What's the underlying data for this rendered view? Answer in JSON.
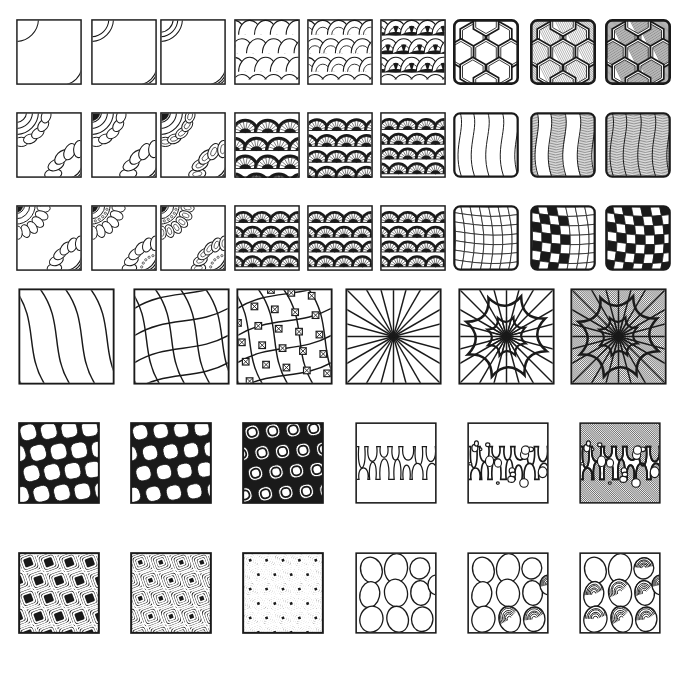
{
  "sheet": {
    "title": "Zentangle Pattern Step-By-Step Reference Sheet",
    "background_color": "#ffffff",
    "ink_color": "#1a1a1a",
    "width": 681,
    "height": 675,
    "row_count": 6,
    "tile_total": 48
  },
  "rows": [
    {
      "index": 1,
      "y": 19,
      "tile_size": 66,
      "groups": [
        {
          "name": "crescent-arcs",
          "label": "Crescent Arcs",
          "steps": [
            "single arc corners",
            "double arc corners",
            "triple arc corners"
          ],
          "tiles": [
            {
              "x": 16,
              "pattern": "arcs",
              "arcs": 1,
              "fill": "none"
            },
            {
              "x": 91,
              "pattern": "arcs",
              "arcs": 2,
              "fill": "none"
            },
            {
              "x": 160,
              "pattern": "arcs",
              "arcs": 3,
              "fill": "none"
            }
          ]
        },
        {
          "name": "fish-scale",
          "label": "Fish Scale / Mooka Scale",
          "steps": [
            "open scales",
            "layered scales",
            "scales with black wedges"
          ],
          "tiles": [
            {
              "x": 234,
              "pattern": "scale",
              "layers": 1,
              "fill": "none"
            },
            {
              "x": 307,
              "pattern": "scale",
              "layers": 2,
              "fill": "none"
            },
            {
              "x": 380,
              "pattern": "scale",
              "layers": 2,
              "fill": "wedges"
            }
          ]
        },
        {
          "name": "honeycomb",
          "label": "Honeycomb / Cubine",
          "steps": [
            "hexagon outline",
            "shaded bevels",
            "deep shaded bevels"
          ],
          "tiles": [
            {
              "x": 453,
              "pattern": "hex",
              "shade": 0
            },
            {
              "x": 530,
              "pattern": "hex",
              "shade": 1
            },
            {
              "x": 605,
              "pattern": "hex",
              "shade": 2
            }
          ]
        }
      ]
    },
    {
      "index": 2,
      "y": 112,
      "tile_size": 66,
      "groups": [
        {
          "name": "corner-flower",
          "label": "Corner Flower Fan",
          "steps": [
            "petal outline",
            "add inner rings",
            "fill black accents"
          ],
          "tiles": [
            {
              "x": 16,
              "pattern": "flower",
              "detail": 1
            },
            {
              "x": 91,
              "pattern": "flower",
              "detail": 2
            },
            {
              "x": 160,
              "pattern": "flower",
              "detail": 3
            }
          ]
        },
        {
          "name": "shell-fan",
          "label": "Shell Fan / Piptail",
          "steps": [
            "sparse fans",
            "dense fans",
            "full field of fans"
          ],
          "tiles": [
            {
              "x": 234,
              "pattern": "fan",
              "density": 1
            },
            {
              "x": 307,
              "pattern": "fan",
              "density": 2
            },
            {
              "x": 380,
              "pattern": "fan",
              "density": 3
            }
          ]
        },
        {
          "name": "wave-bands",
          "label": "Wave Bands / Flux Ribbon",
          "steps": [
            "wave lines only",
            "hatch alternate bands",
            "hatch all bands"
          ],
          "tiles": [
            {
              "x": 453,
              "pattern": "wave",
              "hatched": 0
            },
            {
              "x": 530,
              "pattern": "wave",
              "hatched": 1
            },
            {
              "x": 605,
              "pattern": "wave",
              "hatched": 2
            }
          ]
        }
      ]
    },
    {
      "index": 3,
      "y": 205,
      "tile_size": 66,
      "groups": [
        {
          "name": "mandala-corner",
          "label": "Mandala Corner",
          "steps": [
            "base petals",
            "beaded rings",
            "blacked centers"
          ],
          "tiles": [
            {
              "x": 16,
              "pattern": "mandala",
              "detail": 1
            },
            {
              "x": 91,
              "pattern": "mandala",
              "detail": 2
            },
            {
              "x": 160,
              "pattern": "mandala",
              "detail": 3
            }
          ]
        },
        {
          "name": "shell-fan-dense",
          "label": "Shell Fan Filled",
          "steps": [
            "fans with black",
            "tighter fans",
            "tightest fans"
          ],
          "tiles": [
            {
              "x": 234,
              "pattern": "fan",
              "density": 3
            },
            {
              "x": 307,
              "pattern": "fan",
              "density": 4
            },
            {
              "x": 380,
              "pattern": "fan",
              "density": 4
            }
          ]
        },
        {
          "name": "warped-check",
          "label": "Warped Checkerboard / Bales",
          "steps": [
            "curved grid",
            "half filled",
            "fully filled"
          ],
          "tiles": [
            {
              "x": 453,
              "pattern": "check",
              "filled": 0
            },
            {
              "x": 530,
              "pattern": "check",
              "filled": 1
            },
            {
              "x": 605,
              "pattern": "check",
              "filled": 2
            }
          ]
        }
      ]
    },
    {
      "index": 4,
      "y": 288,
      "tile_size": 97,
      "groups": [
        {
          "name": "curved-lattice",
          "label": "Curved Lattice / Crescent Moon Grid",
          "steps": [
            "curved lines",
            "crossing curves",
            "lattice with knots"
          ],
          "tiles": [
            {
              "x": 18,
              "pattern": "curves",
              "stage": 1
            },
            {
              "x": 133,
              "pattern": "curves",
              "stage": 2
            },
            {
              "x": 236,
              "pattern": "curves",
              "stage": 3
            }
          ]
        },
        {
          "name": "radial-burst",
          "label": "Radial Burst / Paradox Star",
          "steps": [
            "ray fan",
            "add scalloped flower",
            "shade background"
          ],
          "tiles": [
            {
              "x": 345,
              "pattern": "radial",
              "stage": 1
            },
            {
              "x": 458,
              "pattern": "radial",
              "stage": 2
            },
            {
              "x": 570,
              "pattern": "radial",
              "stage": 3
            }
          ]
        }
      ]
    },
    {
      "index": 5,
      "y": 422,
      "tile_size": 82,
      "groups": [
        {
          "name": "black-lattice",
          "label": "Black Lattice / Knightsbridge Net",
          "steps": [
            "open cells",
            "thicker bands",
            "nested cells"
          ],
          "tiles": [
            {
              "x": 18,
              "pattern": "netcell",
              "stage": 1
            },
            {
              "x": 130,
              "pattern": "netcell",
              "stage": 2
            },
            {
              "x": 242,
              "pattern": "netcell",
              "stage": 3
            }
          ]
        },
        {
          "name": "drip-blob",
          "label": "Drip Blobs / Wud",
          "steps": [
            "drip outline",
            "add bubbles",
            "shade the drip"
          ],
          "tiles": [
            {
              "x": 355,
              "pattern": "drip",
              "stage": 1
            },
            {
              "x": 467,
              "pattern": "drip",
              "stage": 2
            },
            {
              "x": 579,
              "pattern": "drip",
              "stage": 3
            }
          ]
        }
      ]
    },
    {
      "index": 6,
      "y": 552,
      "tile_size": 82,
      "groups": [
        {
          "name": "spiral-squares",
          "label": "Spiral Squares / Bantu",
          "steps": [
            "loose spirals",
            "tighter spirals",
            "dense spirals"
          ],
          "tiles": [
            {
              "x": 18,
              "pattern": "spiralsq",
              "stage": 1
            },
            {
              "x": 130,
              "pattern": "spiralsq",
              "stage": 2
            },
            {
              "x": 242,
              "pattern": "spiralsq",
              "stage": 3
            }
          ]
        },
        {
          "name": "pebble-shell",
          "label": "Pebbles to Shells",
          "steps": [
            "plain pebbles",
            "some shelled",
            "all shelled"
          ],
          "tiles": [
            {
              "x": 355,
              "pattern": "pebble",
              "shelled": 0
            },
            {
              "x": 467,
              "pattern": "pebble",
              "shelled": 3
            },
            {
              "x": 579,
              "pattern": "pebble",
              "shelled": 8
            }
          ]
        }
      ]
    }
  ]
}
